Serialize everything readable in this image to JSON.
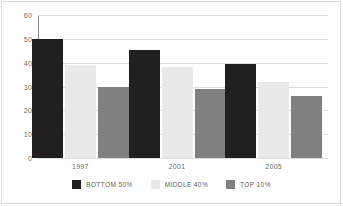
{
  "chart_data": {
    "type": "bar",
    "title": "",
    "subtitle": "",
    "xlabel": "",
    "ylabel": "",
    "categories": [
      "1997",
      "2001",
      "2005"
    ],
    "series": [
      {
        "name": "BOTTOM 50%",
        "color": "#231f20",
        "values": [
          50,
          45.5,
          39.5
        ]
      },
      {
        "name": "MIDDLE 40%",
        "color": "#e9e9e9",
        "values": [
          39,
          38,
          32
        ]
      },
      {
        "name": "TOP 10%",
        "color": "#808080",
        "values": [
          30,
          29,
          26
        ]
      }
    ],
    "ylim": [
      0,
      60
    ],
    "ytick_values": [
      0,
      10,
      20,
      30,
      40,
      50,
      60
    ],
    "ytick_labels": [
      "0",
      "10",
      "20",
      "30",
      "40",
      "50",
      "60"
    ],
    "grid": true,
    "grid_axis": "y",
    "legend_position": "bottom",
    "annotations": []
  },
  "style": {
    "background": "#ffffff",
    "frame_color": "#d9d9d9",
    "axis_color": "#8d8d8d",
    "grid_color": "#dedede",
    "tick_text_color": "#6e6e6e",
    "legend_text_color": "#5d5d5d"
  }
}
